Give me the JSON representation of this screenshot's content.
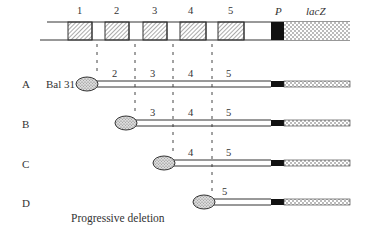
{
  "title": "Progressive deletion",
  "top_construct": {
    "segments": [
      {
        "label": "1",
        "x": 68,
        "w": 24,
        "type": "hatched"
      },
      {
        "label": "2",
        "x": 105,
        "w": 24,
        "type": "hatched"
      },
      {
        "label": "3",
        "x": 143,
        "w": 24,
        "type": "hatched"
      },
      {
        "label": "4",
        "x": 180,
        "w": 26,
        "type": "hatched"
      },
      {
        "label": "5",
        "x": 218,
        "w": 26,
        "type": "hatched"
      }
    ],
    "promoter_label": "P",
    "reporter_label": "lacZ"
  },
  "enzyme_label": "Bal 31",
  "rows": [
    {
      "letter": "A",
      "numbers": [
        "2",
        "3",
        "4",
        "5"
      ]
    },
    {
      "letter": "B",
      "numbers": [
        "3",
        "4",
        "5"
      ]
    },
    {
      "letter": "C",
      "numbers": [
        "4",
        "5"
      ]
    },
    {
      "letter": "D",
      "numbers": [
        "5"
      ]
    }
  ],
  "caption": "Progressive deletion",
  "colors": {
    "line": "#333333",
    "fill_black": "#111111",
    "stipple": "#555555"
  }
}
